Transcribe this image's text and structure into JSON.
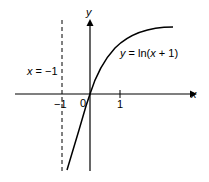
{
  "diagram": {
    "axes": {
      "x_label": "x",
      "y_label": "y",
      "origin_label": "0",
      "ticks": [
        {
          "value": -1,
          "label": "−1"
        },
        {
          "value": 1,
          "label": "1"
        }
      ]
    },
    "curve": {
      "equation_prefix": "y",
      "equation_eq": " = ln(",
      "equation_var": "x",
      "equation_suffix": " + 1)",
      "function": "ln(x + 1)"
    },
    "asymptote": {
      "label_var": "x",
      "label_rest": " = −1",
      "x_value": -1,
      "style": "dashed"
    }
  }
}
